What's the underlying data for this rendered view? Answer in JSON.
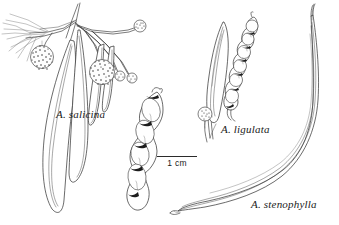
{
  "plate": {
    "kind": "botanical-line-illustration",
    "background_color": "#ffffff",
    "ink_color": "#2b2b2b",
    "width_px": 339,
    "height_px": 225
  },
  "labels": {
    "salicina": "A. salicina",
    "ligulata": "A. ligulata",
    "stenophylla": "A. stenophylla"
  },
  "scale_bar": {
    "caption": "1 cm",
    "length_px": 40,
    "position": "center-lower"
  },
  "specimens": [
    {
      "id": "salicina",
      "label": "A. salicina",
      "position": "left",
      "parts": [
        "flowering branchlet",
        "pendulous phyllodes",
        "globular stippled flower heads",
        "small peduncled flower buds",
        "moniliform pod with 4 seed segments"
      ],
      "flower_heads": 2,
      "flower_buds": 3,
      "pod_seed_segments": 4
    },
    {
      "id": "ligulata",
      "label": "A. ligulata",
      "position": "center-right",
      "parts": [
        "broad obovate phyllode",
        "basal globular flower head",
        "beaded pod with 6 seed bulges"
      ],
      "flower_heads": 1,
      "pod_seed_segments": 6
    },
    {
      "id": "stenophylla",
      "label": "A. stenophylla",
      "position": "right",
      "parts": [
        "very long narrow curved phyllode"
      ],
      "flower_heads": 0,
      "pod_seed_segments": 0
    }
  ]
}
